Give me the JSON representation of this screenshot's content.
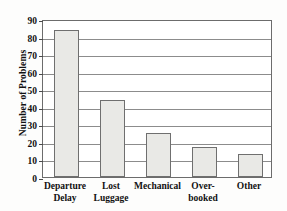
{
  "chart_data": {
    "type": "bar",
    "title": "",
    "xlabel": "",
    "ylabel": "Number of Problems",
    "categories": [
      "Departure Delay",
      "Lost Luggage",
      "Mechanical",
      "Over-booked",
      "Other"
    ],
    "category_lines": [
      [
        "Departure",
        "Delay"
      ],
      [
        "Lost",
        "Luggage"
      ],
      [
        "Mechanical"
      ],
      [
        "Over-",
        "booked"
      ],
      [
        "Other"
      ]
    ],
    "values": [
      84,
      44,
      25,
      17,
      13
    ],
    "ylim": [
      0,
      90
    ],
    "yticks": [
      0,
      10,
      20,
      30,
      40,
      50,
      60,
      70,
      80,
      90
    ],
    "ytick_labels": [
      "0",
      "10",
      "20",
      "30",
      "40",
      "50",
      "60",
      "70",
      "80",
      "90"
    ],
    "grid": true,
    "legend": false,
    "colors": {
      "bar_fill": "#e9e9e6",
      "bar_edge": "#6f6f6f",
      "gridline": "#8c8c8c",
      "axis": "#6c6c6c",
      "text": "#111111",
      "background": "#fdfdfc"
    }
  }
}
